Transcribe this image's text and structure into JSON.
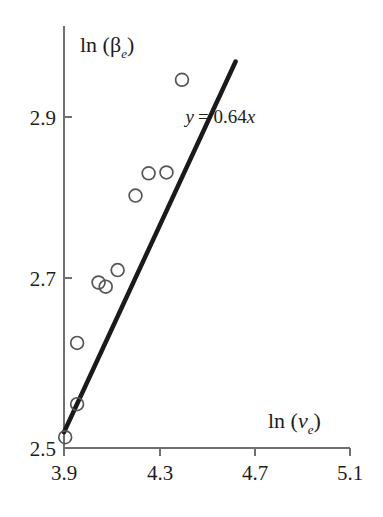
{
  "chart_data": {
    "type": "scatter",
    "title": "",
    "subtitle": "",
    "xlabel": "ln (v_e)",
    "ylabel": "ln (β_e)",
    "xlabel_parts": {
      "prefix": "ln (",
      "var": "v",
      "sub": "e",
      "suffix": ")"
    },
    "ylabel_parts": {
      "prefix": "ln (",
      "var": "β",
      "sub": "e",
      "suffix": ")"
    },
    "xlim": [
      3.9,
      5.1
    ],
    "ylim": [
      2.5,
      2.95
    ],
    "xticks": [
      "3.9",
      "4.3",
      "4.7",
      "5.1"
    ],
    "xtick_values": [
      3.9,
      4.3,
      4.7,
      5.1
    ],
    "yticks": [
      "2.5",
      "2.7",
      "2.9"
    ],
    "ytick_values": [
      2.5,
      2.7,
      2.9
    ],
    "grid": false,
    "legend": null,
    "marker": "open-circle",
    "marker_color": "#555555",
    "line_color": "#1a1a1a",
    "points": [
      {
        "x": 3.905,
        "y": 2.513
      },
      {
        "x": 3.955,
        "y": 2.553
      },
      {
        "x": 3.955,
        "y": 2.627
      },
      {
        "x": 4.045,
        "y": 2.7
      },
      {
        "x": 4.075,
        "y": 2.695
      },
      {
        "x": 4.125,
        "y": 2.715
      },
      {
        "x": 4.2,
        "y": 2.805
      },
      {
        "x": 4.255,
        "y": 2.832
      },
      {
        "x": 4.33,
        "y": 2.833
      },
      {
        "x": 4.395,
        "y": 2.945
      }
    ],
    "fit_line": {
      "label": "y = 0.64x",
      "label_parts": {
        "y": "y",
        "eq": "= 0.64",
        "x": "x"
      },
      "slope": 0.64,
      "intercept": 0.0,
      "x_start": 3.9,
      "x_end": 4.62,
      "y_start": 2.519,
      "y_end": 2.967
    },
    "annotations": [
      {
        "text": "y = 0.64x",
        "x": 4.41,
        "y": 2.893
      }
    ]
  }
}
